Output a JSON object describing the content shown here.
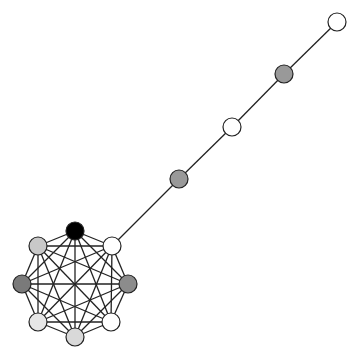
{
  "diagram": {
    "type": "lollipop-graph",
    "node_radius": 9,
    "nodes": [
      {
        "id": "c0",
        "x": 75,
        "y": 231,
        "fill": "#000000"
      },
      {
        "id": "c1",
        "x": 112,
        "y": 246,
        "fill": "#ffffff"
      },
      {
        "id": "c2",
        "x": 128,
        "y": 284,
        "fill": "#8c8c8c"
      },
      {
        "id": "c3",
        "x": 111,
        "y": 322,
        "fill": "#ffffff"
      },
      {
        "id": "c4",
        "x": 75,
        "y": 337,
        "fill": "#d9d9d9"
      },
      {
        "id": "c5",
        "x": 38,
        "y": 322,
        "fill": "#e6e6e6"
      },
      {
        "id": "c6",
        "x": 22,
        "y": 284,
        "fill": "#7a7a7a"
      },
      {
        "id": "c7",
        "x": 38,
        "y": 246,
        "fill": "#c8c8c8"
      },
      {
        "id": "p1",
        "x": 179,
        "y": 179,
        "fill": "#999999"
      },
      {
        "id": "p2",
        "x": 232,
        "y": 127,
        "fill": "#ffffff"
      },
      {
        "id": "p3",
        "x": 284,
        "y": 74,
        "fill": "#999999"
      },
      {
        "id": "p4",
        "x": 337,
        "y": 22,
        "fill": "#ffffff"
      }
    ],
    "clique": [
      "c0",
      "c1",
      "c2",
      "c3",
      "c4",
      "c5",
      "c6",
      "c7"
    ],
    "path_edges": [
      [
        "c1",
        "p1"
      ],
      [
        "p1",
        "p2"
      ],
      [
        "p2",
        "p3"
      ],
      [
        "p3",
        "p4"
      ]
    ]
  }
}
